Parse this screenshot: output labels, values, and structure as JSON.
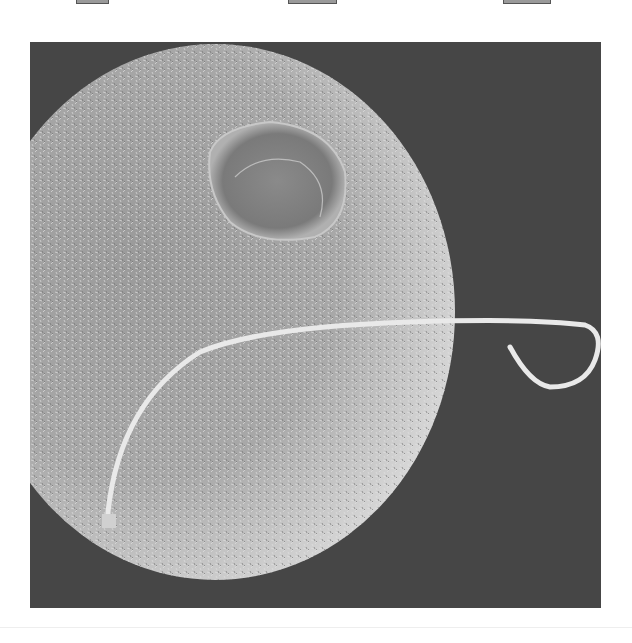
{
  "image": {
    "description": "Scanning electron micrograph of a spherical egg cell covered in microvilli with a sperm cell attached, tail extending to the right",
    "colors": {
      "background": "#4a4a4a",
      "sphere": "#bdbdbd",
      "tail": "#e8e8e8",
      "page": "#ffffff"
    }
  },
  "tabs": [
    {
      "left": 76,
      "width": 31
    },
    {
      "left": 288,
      "width": 47
    },
    {
      "left": 503,
      "width": 46
    }
  ]
}
